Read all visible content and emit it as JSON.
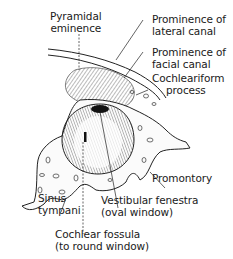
{
  "figure": {
    "type": "anatomical-illustration",
    "labels": [
      {
        "id": "pyramidal-eminence",
        "lines": [
          "Pyramidal",
          "eminence"
        ]
      },
      {
        "id": "prominence-lateral-canal",
        "lines": [
          "Prominence of",
          "lateral canal"
        ]
      },
      {
        "id": "prominence-facial-canal",
        "lines": [
          "Prominence of",
          "facial canal"
        ]
      },
      {
        "id": "cochleariform-process",
        "lines": [
          "Cochleariform",
          "process"
        ]
      },
      {
        "id": "promontory",
        "lines": [
          "Promontory"
        ]
      },
      {
        "id": "sinus-tympani",
        "lines": [
          "Sinus",
          "tympani"
        ]
      },
      {
        "id": "vestibular-fenestra",
        "lines": [
          "Vestibular fenestra",
          "(oval window)"
        ]
      },
      {
        "id": "cochlear-fossula",
        "lines": [
          "Cochlear fossula",
          "(to round window)"
        ]
      }
    ]
  }
}
